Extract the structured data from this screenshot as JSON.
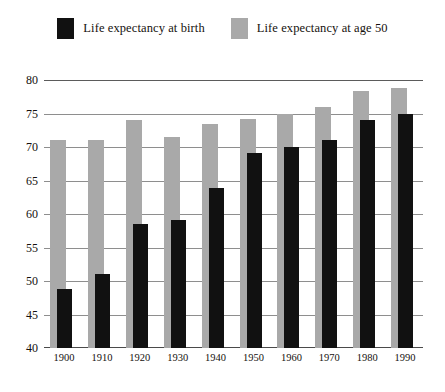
{
  "chart_data": {
    "type": "bar",
    "title": "",
    "subtitle": "",
    "xlabel": "",
    "ylabel": "",
    "ylim": [
      40,
      80
    ],
    "ytick_step": 5,
    "yticks": [
      "40",
      "45",
      "50",
      "55",
      "60",
      "65",
      "70",
      "75",
      "80"
    ],
    "grid": true,
    "legend_position": "top-center",
    "categories": [
      "1900",
      "1910",
      "1920",
      "1930",
      "1940",
      "1950",
      "1960",
      "1970",
      "1980",
      "1990"
    ],
    "series": [
      {
        "name": "Life expectancy at birth",
        "color": "#111111",
        "values": [
          48.8,
          51.1,
          58.5,
          59.1,
          63.9,
          69.1,
          70.0,
          71.0,
          74.0,
          75.0
        ]
      },
      {
        "name": "Life expectancy at age 50",
        "color": "#a9a9a9",
        "values": [
          71.0,
          71.0,
          74.1,
          71.5,
          73.5,
          74.2,
          75.0,
          76.0,
          78.3,
          78.8
        ]
      }
    ]
  },
  "legend": {
    "entries": [
      {
        "label": "Life expectancy at birth",
        "swatch_color": "#111111",
        "swatch_name": "legend-swatch-birth"
      },
      {
        "label": "Life expectancy at age 50",
        "swatch_color": "#a9a9a9",
        "swatch_name": "legend-swatch-age50"
      }
    ]
  },
  "axes": {
    "y": {
      "ticks": [
        "80",
        "75",
        "70",
        "65",
        "60",
        "55",
        "50",
        "45",
        "40"
      ]
    },
    "x": {
      "ticks": [
        "1900",
        "1910",
        "1920",
        "1930",
        "1940",
        "1950",
        "1960",
        "1970",
        "1980",
        "1990"
      ]
    }
  },
  "colors": {
    "series_black": "#111111",
    "series_gray": "#a9a9a9",
    "gridline": "#8e8e8e",
    "axis": "#4a4a4a",
    "background": "#ffffff",
    "text": "#15110e"
  }
}
